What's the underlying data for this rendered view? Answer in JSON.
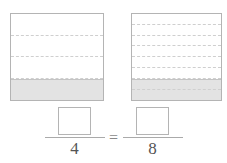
{
  "figure": {
    "type": "fraction-model-equivalence",
    "models": [
      {
        "name": "left-model",
        "total_parts": 4,
        "shaded_parts": 1,
        "fraction": "1/4",
        "orientation": "horizontal-strips",
        "shaded_position": "bottom"
      },
      {
        "name": "right-model",
        "total_parts": 8,
        "shaded_parts": 2,
        "fraction": "2/8",
        "orientation": "horizontal-strips",
        "shaded_position": "bottom"
      }
    ]
  },
  "equation": {
    "left_fraction": {
      "numerator_value": "",
      "numerator_placeholder": "",
      "denominator": "4"
    },
    "operator": "=",
    "right_fraction": {
      "numerator_value": "",
      "numerator_placeholder": "",
      "denominator": "8"
    }
  },
  "colors": {
    "shading": "#e3e3e3",
    "outline": "#b4b4b4",
    "dashed_divider": "#cfcfcf",
    "numeral": "#555555",
    "background": "#ffffff"
  }
}
